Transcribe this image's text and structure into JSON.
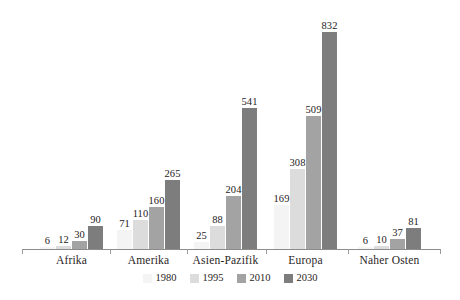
{
  "chart_data": {
    "type": "bar",
    "title": "",
    "subtitle": "",
    "xlabel": "",
    "ylabel": "",
    "grid": false,
    "legend_position": "bottom",
    "axis_visible": {
      "x": true,
      "y": false
    },
    "ylim": [
      0,
      900
    ],
    "categories": [
      "Afrika",
      "Amerika",
      "Asien-Pazifik",
      "Europa",
      "Naher Osten"
    ],
    "series": [
      {
        "name": "1980",
        "color": "#f4f4f4",
        "values": [
          6,
          71,
          25,
          169,
          6
        ]
      },
      {
        "name": "1995",
        "color": "#dcdcdc",
        "values": [
          12,
          110,
          88,
          308,
          10
        ]
      },
      {
        "name": "2010",
        "color": "#a3a3a3",
        "values": [
          30,
          160,
          204,
          509,
          37
        ]
      },
      {
        "name": "2030",
        "color": "#7d7d7d",
        "values": [
          90,
          265,
          541,
          832,
          81
        ]
      }
    ],
    "data_labels": [
      [
        "6",
        "12",
        "30",
        "90"
      ],
      [
        "71",
        "110",
        "160",
        "265"
      ],
      [
        "25",
        "88",
        "204",
        "541"
      ],
      [
        "169",
        "308",
        "509",
        "832"
      ],
      [
        "6",
        "10",
        "37",
        "81"
      ]
    ]
  },
  "legend": {
    "items": [
      {
        "label": "1980"
      },
      {
        "label": "1995"
      },
      {
        "label": "2010"
      },
      {
        "label": "2030"
      }
    ]
  },
  "axis": {
    "categories": [
      {
        "label": "Afrika"
      },
      {
        "label": "Amerika"
      },
      {
        "label": "Asien-Pazifik"
      },
      {
        "label": "Europa"
      },
      {
        "label": "Naher Osten"
      }
    ]
  }
}
